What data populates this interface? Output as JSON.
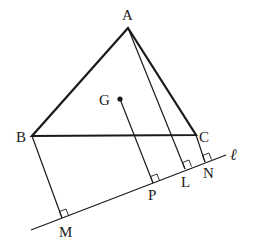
{
  "diagram": {
    "type": "geometry",
    "points": {
      "A": {
        "label": "A",
        "x": 128,
        "y": 28
      },
      "B": {
        "label": "B",
        "x": 32,
        "y": 136
      },
      "C": {
        "label": "C",
        "x": 196,
        "y": 135
      },
      "G": {
        "label": "G",
        "x": 120,
        "y": 99
      },
      "M": {
        "label": "M",
        "x": 62,
        "y": 218
      },
      "P": {
        "label": "P",
        "x": 153,
        "y": 183
      },
      "L": {
        "label": "L",
        "x": 185,
        "y": 169
      },
      "N": {
        "label": "N",
        "x": 205,
        "y": 162
      }
    },
    "line": {
      "label": "ℓ",
      "x1": 31,
      "y1": 230,
      "x2": 226,
      "y2": 155
    },
    "segments": [
      {
        "from": "A",
        "to": "B",
        "style": "thick"
      },
      {
        "from": "B",
        "to": "C",
        "style": "thick"
      },
      {
        "from": "C",
        "to": "A",
        "style": "thick"
      },
      {
        "from": "B",
        "to": "M",
        "style": "thin"
      },
      {
        "from": "G",
        "to": "P",
        "style": "thin"
      },
      {
        "from": "A",
        "to": "L",
        "style": "thin"
      },
      {
        "from": "C",
        "to": "N",
        "style": "thin"
      }
    ],
    "right_angle_marks": [
      "M",
      "P",
      "L",
      "N"
    ],
    "labels": {
      "A": "A",
      "B": "B",
      "C": "C",
      "G": "G",
      "M": "M",
      "P": "P",
      "L": "L",
      "N": "N",
      "line": "ℓ"
    }
  }
}
